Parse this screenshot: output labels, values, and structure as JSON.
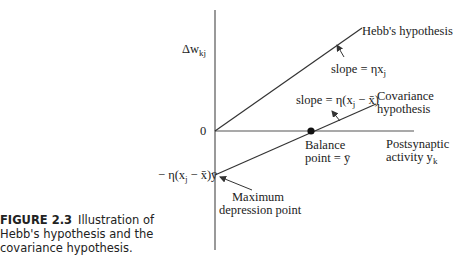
{
  "caption": {
    "figure_label": "FIGURE 2.3",
    "text": "Illustration of Hebb's hypothesis and the covariance hypothesis."
  },
  "axes": {
    "y_label": "Δw",
    "y_label_sub": "kj",
    "origin_label": "0",
    "x_label_line1": "Postsynaptic",
    "x_label_line2": "activity y",
    "x_label_sub": "k"
  },
  "lines": {
    "hebb": {
      "label": "Hebb's hypothesis",
      "slope_label": "slope = ηx",
      "slope_sub": "j"
    },
    "covariance": {
      "label_line1": "Covariance",
      "label_line2": "hypothesis",
      "slope_label": "slope = η(x",
      "slope_sub": "j",
      "slope_tail": " − x̄)"
    }
  },
  "points": {
    "balance_line1": "Balance",
    "balance_line2": "point = ȳ",
    "depression_value_prefix": "− η(x",
    "depression_value_sub": "j",
    "depression_value_tail": " − x̄)ȳ",
    "depression_line1": "Maximum",
    "depression_line2": "depression point"
  },
  "colors": {
    "line": "#333333",
    "text": "#222222"
  }
}
